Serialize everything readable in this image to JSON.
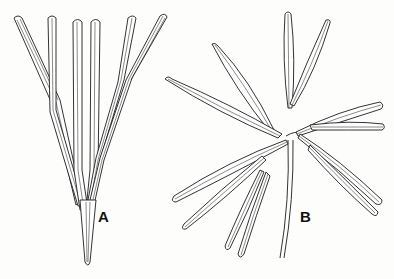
{
  "figure": {
    "panels": [
      {
        "label": "A",
        "description": "palmately divided leaf with narrow erect lobes"
      },
      {
        "label": "B",
        "description": "radially divided leaf with spreading lanceolate segments"
      }
    ],
    "colors": {
      "line": "#1c1c1c",
      "background": "#fdfdfb"
    }
  }
}
